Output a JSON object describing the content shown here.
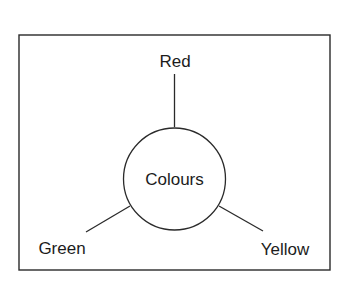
{
  "diagram": {
    "type": "mind-map",
    "center": {
      "label": "Colours"
    },
    "branches": [
      {
        "id": "red",
        "label": "Red",
        "position": "top"
      },
      {
        "id": "green",
        "label": "Green",
        "position": "bottom-left"
      },
      {
        "id": "yellow",
        "label": "Yellow",
        "position": "bottom-right"
      }
    ]
  },
  "colors": {
    "stroke": "#2a2a2a",
    "text": "#1c1c1c",
    "background": "#ffffff"
  }
}
